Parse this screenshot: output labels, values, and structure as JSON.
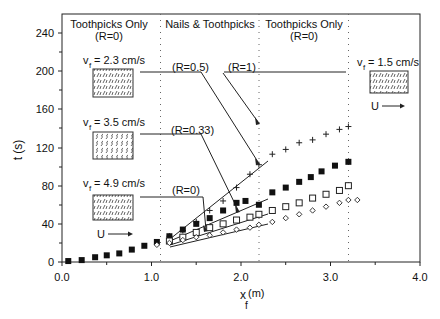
{
  "chart_data": {
    "type": "scatter",
    "title": "",
    "xlabel": "x_f (m)",
    "ylabel": "t (s)",
    "xlim": [
      0.0,
      4.0
    ],
    "ylim": [
      0,
      250
    ],
    "x_ticks": [
      "0.0",
      "1.0",
      "2.0",
      "3.0",
      "4.0"
    ],
    "y_ticks": [
      "0",
      "40",
      "80",
      "120",
      "160",
      "200",
      "240"
    ],
    "grid": false,
    "region_boundaries_x": [
      1.1,
      2.2,
      3.2
    ],
    "regions": [
      {
        "label": "Toothpicks Only",
        "sublabel": "(R=0)"
      },
      {
        "label": "Nails & Toothpicks",
        "sublabel": ""
      },
      {
        "label": "Toothpicks Only",
        "sublabel": "(R=0)"
      }
    ],
    "annotations": {
      "velocities": [
        {
          "text": "v_f = 2.3 cm/s"
        },
        {
          "text": "v_f = 3.5 cm/s"
        },
        {
          "text": "v_f = 4.9 cm/s"
        },
        {
          "text": "v_f = 1.5 cm/s"
        }
      ],
      "ratios": [
        "(R=0.5)",
        "(R=1)",
        "(R=0.33)",
        "(R=0)"
      ],
      "flow_label": "U"
    },
    "series": [
      {
        "name": "R=1 (plus)",
        "marker": "plus",
        "x": [
          1.2,
          1.35,
          1.5,
          1.65,
          1.8,
          1.95,
          2.1,
          2.2,
          2.35,
          2.5,
          2.65,
          2.8,
          2.95,
          3.1,
          3.2
        ],
        "y": [
          27,
          33,
          42,
          54,
          64,
          78,
          92,
          102,
          113,
          118,
          125,
          128,
          134,
          139,
          142
        ]
      },
      {
        "name": "R=0.5 (filled square)",
        "marker": "filled-square",
        "x": [
          0.07,
          0.22,
          0.37,
          0.5,
          0.64,
          0.78,
          0.92,
          1.06,
          1.2,
          1.35,
          1.5,
          1.65,
          1.8,
          1.95,
          2.05,
          2.2,
          2.35,
          2.5,
          2.65,
          2.78,
          2.9,
          3.05,
          3.2
        ],
        "y": [
          1,
          2,
          5,
          7,
          9,
          13,
          17,
          21,
          27,
          34,
          40,
          46,
          54,
          62,
          64,
          60,
          73,
          78,
          84,
          89,
          95,
          101,
          105
        ]
      },
      {
        "name": "R=0.33 (open square)",
        "marker": "open-square",
        "x": [
          1.2,
          1.35,
          1.5,
          1.65,
          1.8,
          1.95,
          2.1,
          2.2,
          2.35,
          2.5,
          2.65,
          2.8,
          2.95,
          3.1,
          3.2
        ],
        "y": [
          22,
          26,
          31,
          36,
          40,
          44,
          47,
          50,
          54,
          58,
          62,
          67,
          71,
          75,
          80
        ]
      },
      {
        "name": "R=0 (open diamond)",
        "marker": "open-diamond",
        "x": [
          1.06,
          1.2,
          1.35,
          1.5,
          1.65,
          1.8,
          1.95,
          2.1,
          2.2,
          2.35,
          2.5,
          2.65,
          2.8,
          2.95,
          3.1,
          3.2,
          3.3
        ],
        "y": [
          18,
          20,
          23,
          26,
          28,
          31,
          34,
          36,
          39,
          42,
          46,
          50,
          54,
          58,
          62,
          65,
          65
        ]
      }
    ],
    "fit_lines": [
      {
        "name": "R=1 fit",
        "x": [
          1.2,
          2.3
        ],
        "y": [
          24,
          106
        ]
      },
      {
        "name": "R=0.5 fit",
        "x": [
          1.2,
          2.3
        ],
        "y": [
          22,
          65
        ]
      },
      {
        "name": "R=0.33 fit",
        "x": [
          1.2,
          2.3
        ],
        "y": [
          18,
          50
        ]
      },
      {
        "name": "R=0 fit",
        "x": [
          1.2,
          2.3
        ],
        "y": [
          16,
          40
        ]
      }
    ]
  },
  "labels": {
    "region1": "Toothpicks Only",
    "region1_sub": "(R=0)",
    "region2": "Nails & Toothpicks",
    "region3": "Toothpicks Only",
    "region3_sub": "(R=0)",
    "v1_main": "v",
    "v1_sub": "f",
    "v1_val": " = 2.3 cm/s",
    "v2_val": " = 3.5 cm/s",
    "v3_val": " = 4.9 cm/s",
    "v4_val": " = 1.5 cm/s",
    "r05": "(R=0.5)",
    "r1": "(R=1)",
    "r033": "(R=0.33)",
    "r0": "(R=0)",
    "u": "U",
    "ylabel": "t  (s)",
    "xlabel_main": "x",
    "xlabel_sub": "f",
    "xlabel_unit": "(m)"
  }
}
